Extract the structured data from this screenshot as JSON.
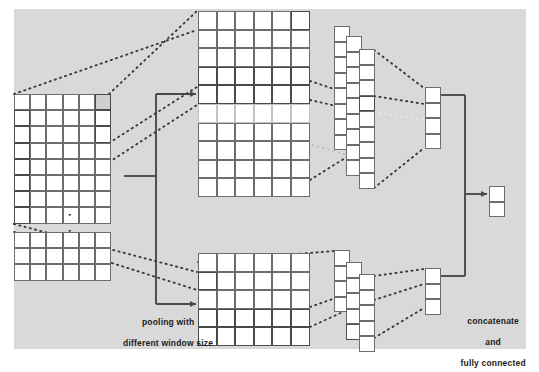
{
  "figure": {
    "type": "neural-network-architecture-diagram",
    "background_color": "#d9d9d9",
    "page_color": "#ffffff",
    "line_color": "#4a4a4a",
    "grid_line_color": "#6d6d6d",
    "cell_fill": "#ffffff",
    "highlight_fill": "#cfcfcf"
  },
  "labels": {
    "pooling": {
      "line1": "pooling with",
      "line2": "different window size"
    },
    "concatenate": {
      "line1": "concatenate",
      "line2": "and",
      "line3": "fully connected"
    }
  },
  "ellipsis": {
    "symbol": "▪",
    "count": 2,
    "meaning": "vertical-ellipsis-between-input-feature-maps"
  },
  "blocks": {
    "input_top": {
      "name": "input-feature-map-top",
      "cols": 6,
      "rows": 8,
      "x": 14,
      "y": 94,
      "cell": 16.2,
      "highlight_cells": [
        {
          "col": 5,
          "row": 0,
          "style": "shade"
        },
        {
          "col": 5,
          "row": 1,
          "style": "bold"
        },
        {
          "col": 5,
          "row": 2,
          "style": "bold"
        },
        {
          "col": 0,
          "row": 1,
          "style": "bold"
        },
        {
          "col": 0,
          "row": 2,
          "style": "bold"
        },
        {
          "col": 0,
          "row": 3,
          "style": "bold"
        },
        {
          "col": 0,
          "row": 4,
          "style": "bold"
        },
        {
          "col": 0,
          "row": 5,
          "style": "bold"
        },
        {
          "col": 0,
          "row": 6,
          "style": "bold"
        },
        {
          "col": 0,
          "row": 7,
          "style": "bold"
        }
      ]
    },
    "input_bottom": {
      "name": "input-feature-map-bottom",
      "cols": 6,
      "rows": 3,
      "x": 14,
      "y": 232,
      "cell": 16.2,
      "highlight_cells": []
    },
    "pooled_top": {
      "name": "pooled-map-top",
      "cols": 6,
      "rows": 10,
      "x": 198,
      "y": 11,
      "cell": 18.6,
      "highlight_cells": [
        {
          "col": 5,
          "row": 0,
          "style": "bold"
        },
        {
          "col": 0,
          "row": 3,
          "style": "bold"
        },
        {
          "col": 1,
          "row": 3,
          "style": "bold"
        },
        {
          "col": 2,
          "row": 3,
          "style": "bold"
        },
        {
          "col": 3,
          "row": 3,
          "style": "bold"
        },
        {
          "col": 4,
          "row": 3,
          "style": "bold"
        },
        {
          "col": 5,
          "row": 3,
          "style": "bold"
        },
        {
          "col": 0,
          "row": 4,
          "style": "bold"
        },
        {
          "col": 1,
          "row": 4,
          "style": "bold"
        },
        {
          "col": 2,
          "row": 4,
          "style": "bold"
        },
        {
          "col": 3,
          "row": 4,
          "style": "bold"
        },
        {
          "col": 4,
          "row": 4,
          "style": "bold"
        },
        {
          "col": 5,
          "row": 4,
          "style": "bold"
        },
        {
          "col": 0,
          "row": 5,
          "style": "faint"
        },
        {
          "col": 1,
          "row": 5,
          "style": "faint"
        },
        {
          "col": 2,
          "row": 5,
          "style": "faint"
        },
        {
          "col": 3,
          "row": 5,
          "style": "faint"
        },
        {
          "col": 4,
          "row": 5,
          "style": "faint"
        },
        {
          "col": 5,
          "row": 5,
          "style": "faint"
        }
      ]
    },
    "pooled_bottom": {
      "name": "pooled-map-bottom",
      "cols": 6,
      "rows": 5,
      "x": 198,
      "y": 253,
      "cell": 18.6,
      "highlight_cells": [
        {
          "col": 0,
          "row": 1,
          "style": "bold"
        },
        {
          "col": 0,
          "row": 3,
          "style": "bold"
        },
        {
          "col": 1,
          "row": 3,
          "style": "bold"
        },
        {
          "col": 2,
          "row": 3,
          "style": "bold"
        },
        {
          "col": 3,
          "row": 3,
          "style": "bold"
        },
        {
          "col": 4,
          "row": 3,
          "style": "bold"
        },
        {
          "col": 5,
          "row": 3,
          "style": "bold"
        },
        {
          "col": 0,
          "row": 4,
          "style": "bold"
        },
        {
          "col": 1,
          "row": 4,
          "style": "bold"
        },
        {
          "col": 2,
          "row": 4,
          "style": "bold"
        },
        {
          "col": 3,
          "row": 4,
          "style": "bold"
        },
        {
          "col": 4,
          "row": 4,
          "style": "bold"
        },
        {
          "col": 5,
          "row": 4,
          "style": "bold"
        }
      ]
    },
    "vec_top_a": {
      "name": "flatten-vector-top-back",
      "cols": 1,
      "rows": 8,
      "x": 334,
      "y": 26,
      "cell": 15.5,
      "highlight_cells": []
    },
    "vec_top_b": {
      "name": "flatten-vector-top-middle",
      "cols": 1,
      "rows": 9,
      "x": 346,
      "y": 36,
      "cell": 15.5,
      "highlight_cells": []
    },
    "vec_top_c": {
      "name": "flatten-vector-top-front",
      "cols": 1,
      "rows": 9,
      "x": 359,
      "y": 49,
      "cell": 15.5,
      "highlight_cells": [
        {
          "col": 0,
          "row": 3,
          "style": "bold"
        }
      ]
    },
    "vec_bot_a": {
      "name": "flatten-vector-bottom-back",
      "cols": 1,
      "rows": 4,
      "x": 334,
      "y": 250,
      "cell": 15.5,
      "highlight_cells": []
    },
    "vec_bot_b": {
      "name": "flatten-vector-bottom-middle",
      "cols": 1,
      "rows": 5,
      "x": 346,
      "y": 262,
      "cell": 15.5,
      "highlight_cells": [
        {
          "col": 0,
          "row": 4,
          "style": "bold"
        }
      ]
    },
    "vec_bot_c": {
      "name": "flatten-vector-bottom-front",
      "cols": 1,
      "rows": 5,
      "x": 359,
      "y": 274,
      "cell": 15.5,
      "highlight_cells": []
    },
    "fc_top": {
      "name": "fully-connected-vector-top",
      "cols": 1,
      "rows": 4,
      "x": 425,
      "y": 87,
      "cell": 15.5,
      "highlight_cells": []
    },
    "fc_bottom": {
      "name": "fully-connected-vector-bottom",
      "cols": 1,
      "rows": 3,
      "x": 425,
      "y": 268,
      "cell": 15.5,
      "highlight_cells": []
    },
    "output": {
      "name": "output-vector",
      "cols": 1,
      "rows": 2,
      "x": 489,
      "y": 186,
      "cell": 15.5,
      "highlight_cells": []
    }
  }
}
